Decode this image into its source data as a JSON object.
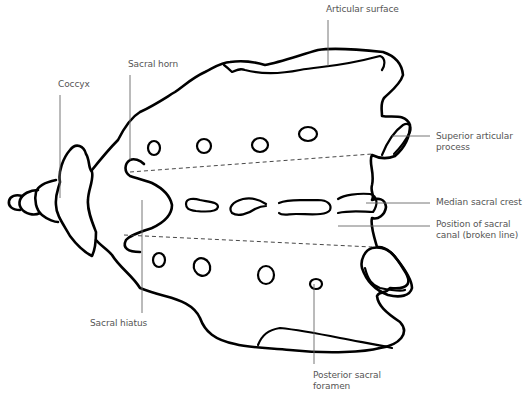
{
  "diagram": {
    "labels": {
      "articular_surface": "Articular surface",
      "sacral_horn": "Sacral horn",
      "coccyx": "Coccyx",
      "superior_articular_process_1": "Superior articular",
      "superior_articular_process_2": "process",
      "median_sacral_crest": "Median sacral crest",
      "sacral_canal_1": "Position of sacral",
      "sacral_canal_2": "canal (broken line)",
      "sacral_hiatus": "Sacral hiatus",
      "posterior_sacral_foramen_1": "Posterior sacral",
      "posterior_sacral_foramen_2": "foramen"
    },
    "colors": {
      "outline": "#000000",
      "leader": "#666666",
      "label_text": "#555555",
      "background": "#ffffff"
    }
  }
}
